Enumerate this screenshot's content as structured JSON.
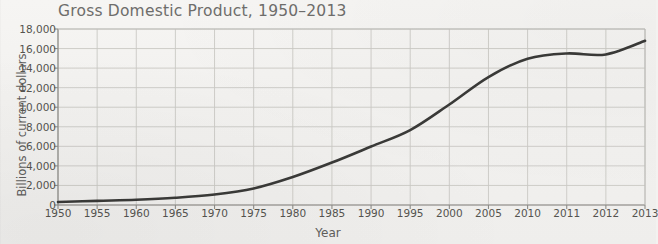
{
  "chart_data": {
    "type": "line",
    "title": "Gross Domestic Product, 1950–2013",
    "xlabel": "Year",
    "ylabel": "Billions of current dollars",
    "grid": true,
    "legend": "none",
    "ylim": [
      0,
      18000
    ],
    "ytick_labels": [
      "0",
      "2,000",
      "4,000",
      "6,000",
      "8,000",
      "10,000",
      "12,000",
      "14,000",
      "16,000",
      "18,000"
    ],
    "ytick_values": [
      0,
      2000,
      4000,
      6000,
      8000,
      10000,
      12000,
      14000,
      16000,
      18000
    ],
    "xtick_labels": [
      "1950",
      "1955",
      "1960",
      "1965",
      "1970",
      "1975",
      "1980",
      "1985",
      "1990",
      "1995",
      "2000",
      "2005",
      "2010",
      "2011",
      "2012",
      "2013"
    ],
    "xtick_values": [
      1950,
      1955,
      1960,
      1965,
      1970,
      1975,
      1980,
      1985,
      1990,
      1995,
      2000,
      2005,
      2010,
      2011,
      2012,
      2013
    ],
    "x_axis_note": "Ticks evenly spaced: 5-year steps through 2010, then single years 2011, 2012, 2013",
    "line_color": "#3a3a38",
    "grid_color": "#c9c8c4",
    "series": [
      {
        "name": "Gross Domestic Product",
        "x": [
          1950,
          1955,
          1960,
          1965,
          1970,
          1975,
          1980,
          1985,
          1990,
          1995,
          2000,
          2005,
          2010,
          2011,
          2012,
          2013
        ],
        "values": [
          300,
          425,
          540,
          740,
          1075,
          1690,
          2860,
          4340,
          5980,
          7660,
          10280,
          13090,
          14960,
          15500,
          15400,
          16800
        ]
      }
    ]
  }
}
